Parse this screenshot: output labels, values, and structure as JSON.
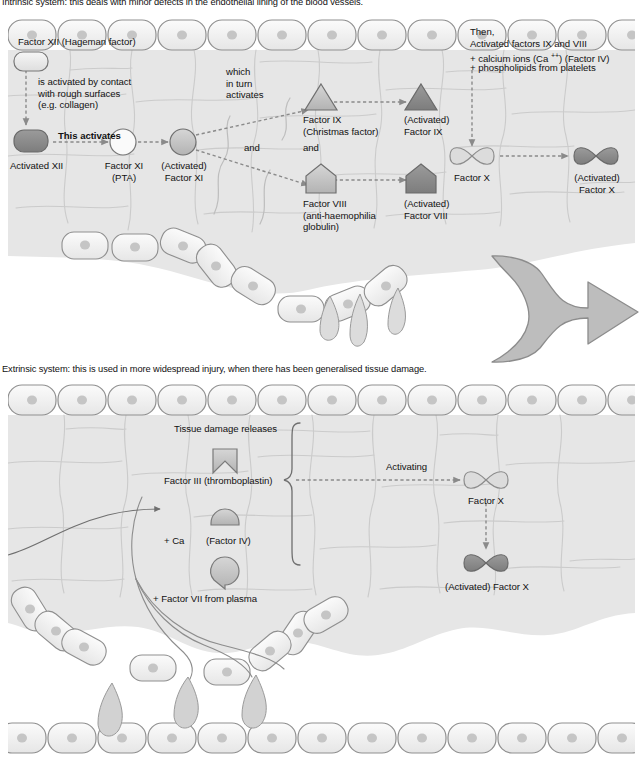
{
  "document": {
    "title": "Blood coagulation cascade — intrinsic and extrinsic systems"
  },
  "captions": {
    "intrinsic": "Intrinsic system: this deals with minor defects in the endothelial lining of the blood vessels.",
    "extrinsic": "Extrinsic system: this is used in more widespread injury, when there has been generalised tissue damage."
  },
  "colors": {
    "inactive_fill": "#e9e9e9",
    "activated_fill": "#8e8e8e",
    "mid_fill": "#c3c3c3",
    "shape_stroke": "#6d6d6d",
    "cell_fill": "#f2f2f2",
    "cell_stroke": "#9a9a9a",
    "tissue_fill": "#e4e4e4",
    "tissue_stroke": "#c6c6c6",
    "arrow_gray": "#b8b8b8",
    "arrow_outline": "#8c8c8c",
    "dashed_arrow": "#8a8a8a",
    "text": "#111111"
  },
  "intrinsic": {
    "name": "intrinsic-pathway-diagram",
    "labels": {
      "factor_xii": "Factor XII (Hageman factor)",
      "activation_note": "is activated by contact\nwith rough surfaces\n(e.g. collagen)",
      "this_activates": "This activates",
      "activated_xii": "Activated XII",
      "factor_xi": "Factor XI\n(PTA)",
      "activated_xi": "(Activated)\nFactor XI",
      "which_in_turn_activates": "which\nin turn\nactivates",
      "and": "and",
      "and_small": "and",
      "factor_ix": "Factor IX\n(Christmas factor)",
      "activated_ix": "(Activated)\nFactor IX",
      "factor_viii": "Factor VIII\n(anti-haemophilia\nglobulin)",
      "activated_viii": "(Activated)\nFactor VIII",
      "then_block_line1": "Then,",
      "then_block_line2": "Activated factors IX and VIII",
      "then_block_line3_a": "+ calcium ions (Ca ",
      "then_block_line3_sup": "++",
      "then_block_line3_b": ") (Factor IV)",
      "then_block_line4": "+ phospholipids from platelets",
      "factor_x": "Factor X",
      "activated_x": "(Activated)\nFactor X"
    },
    "shapes": [
      {
        "id": "factor-xii",
        "type": "rounded-rect",
        "state": "inactive"
      },
      {
        "id": "activated-xii",
        "type": "rounded-rect",
        "state": "activated"
      },
      {
        "id": "factor-xi",
        "type": "circle",
        "state": "inactive"
      },
      {
        "id": "activated-xi",
        "type": "circle",
        "state": "mid"
      },
      {
        "id": "factor-ix",
        "type": "triangle",
        "state": "mid"
      },
      {
        "id": "activated-ix",
        "type": "triangle",
        "state": "activated"
      },
      {
        "id": "factor-viii",
        "type": "pentagon",
        "state": "mid"
      },
      {
        "id": "activated-viii",
        "type": "pentagon",
        "state": "activated"
      },
      {
        "id": "factor-x",
        "type": "bowtie",
        "state": "inactive"
      },
      {
        "id": "activated-x",
        "type": "bowtie",
        "state": "activated"
      }
    ]
  },
  "extrinsic": {
    "name": "extrinsic-pathway-diagram",
    "labels": {
      "tissue_damage_releases": "Tissue damage releases",
      "factor_iii": "Factor III (thromboplastin)",
      "plus_ca": "+ Ca",
      "factor_iv": "(Factor IV)",
      "factor_vii": "+ Factor VII from plasma",
      "activating": "Activating",
      "factor_x": "Factor X",
      "activated_x": "(Activated) Factor X"
    },
    "shapes": [
      {
        "id": "factor-iii",
        "type": "notched-square",
        "state": "mid"
      },
      {
        "id": "factor-iv",
        "type": "dome",
        "state": "mid"
      },
      {
        "id": "factor-vii",
        "type": "shield",
        "state": "mid"
      },
      {
        "id": "factor-x",
        "type": "bowtie",
        "state": "inactive"
      },
      {
        "id": "activated-x",
        "type": "bowtie",
        "state": "activated"
      }
    ]
  },
  "connector": {
    "name": "merge-arrow",
    "description": "large grey double-curved merging arrow pointing right"
  }
}
